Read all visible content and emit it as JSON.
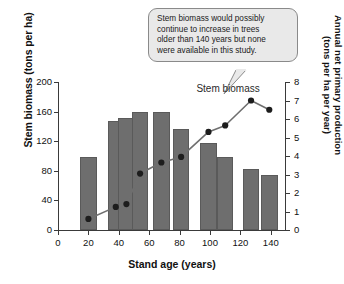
{
  "chart_data": {
    "type": "bar",
    "title": "",
    "xlabel": "Stand age (years)",
    "ylabel": "Stem biomass (tons per ha)",
    "ylabel_right": "Annual net primary production\n(tons per ha per year)",
    "xlim": [
      0,
      150
    ],
    "ylim": [
      0,
      200
    ],
    "ylim_right": [
      0,
      8
    ],
    "grid": false,
    "legend": "none",
    "x_ticks": [
      0,
      20,
      40,
      60,
      80,
      100,
      120,
      140
    ],
    "y_ticks_left": [
      0,
      40,
      80,
      120,
      160,
      200
    ],
    "y_ticks_right": [
      0,
      1,
      2,
      3,
      4,
      5,
      6,
      7,
      8
    ],
    "categories": [
      20,
      38,
      45,
      54,
      68,
      81,
      99,
      110,
      127,
      139
    ],
    "series": [
      {
        "name": "Stem biomass",
        "type": "bar",
        "axis": "left",
        "units": "tons per ha",
        "values": [
          98,
          147,
          152,
          160,
          160,
          136,
          117,
          98,
          83,
          74
        ]
      },
      {
        "name": "Annual net primary production",
        "type": "line",
        "axis": "right",
        "units": "tons per ha per year",
        "values": [
          0.6,
          1.25,
          1.4,
          3.05,
          3.65,
          3.95,
          5.3,
          5.65,
          7.0,
          6.5
        ]
      }
    ],
    "annotations": [
      {
        "name": "series-label",
        "text": "Stem biomass"
      },
      {
        "name": "callout",
        "text": "Stem biomass would possibly\ncontinue to increase in trees\nolder than 140 years but none\nwere available in this study."
      }
    ],
    "colors": {
      "bar_fill": "#6e6e6e",
      "line": "#6f6f6f",
      "marker": "#1d1d1d",
      "axis": "#3a3a3a",
      "callout_bg": "#e9e9e9",
      "callout_border": "#8a8a8a"
    }
  }
}
